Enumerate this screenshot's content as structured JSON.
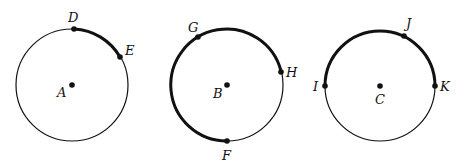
{
  "diagram": {
    "colors": {
      "stroke": "#111111",
      "background": "#ffffff"
    },
    "circles": [
      {
        "center_label": "A",
        "center": [
          72,
          85
        ],
        "radius": 56,
        "points": [
          {
            "label": "D",
            "pos": [
              74,
              28
            ],
            "label_pos": [
              68,
              21
            ]
          },
          {
            "label": "E",
            "pos": [
              120,
              57
            ],
            "label_pos": [
              125,
              54
            ]
          }
        ],
        "bold_arc": {
          "from": "D",
          "to": "E",
          "direction": "clockwise"
        },
        "center_label_pos": [
          58,
          98
        ]
      },
      {
        "center_label": "B",
        "center": [
          227,
          85
        ],
        "radius": 56,
        "points": [
          {
            "label": "G",
            "pos": [
              198,
              36
            ],
            "label_pos": [
              188,
              32
            ]
          },
          {
            "label": "H",
            "pos": [
              281,
              73
            ],
            "label_pos": [
              286,
              76
            ]
          },
          {
            "label": "F",
            "pos": [
              227,
              142
            ],
            "label_pos": [
              222,
              160
            ]
          }
        ],
        "bold_arc": {
          "from": "F",
          "to": "H",
          "via": "G",
          "direction": "clockwise"
        },
        "center_label_pos": [
          213,
          98
        ]
      },
      {
        "center_label": "C",
        "center": [
          380,
          86
        ],
        "radius": 55,
        "points": [
          {
            "label": "I",
            "pos": [
              325,
              86
            ],
            "label_pos": [
              313,
              90
            ]
          },
          {
            "label": "J",
            "pos": [
              404,
              34
            ],
            "label_pos": [
              406,
              28
            ]
          },
          {
            "label": "K",
            "pos": [
              435,
              86
            ],
            "label_pos": [
              440,
              90
            ]
          }
        ],
        "bold_arc": {
          "from": "I",
          "to": "K",
          "via": "J",
          "direction": "clockwise"
        },
        "center_label_pos": [
          375,
          104
        ]
      }
    ]
  }
}
